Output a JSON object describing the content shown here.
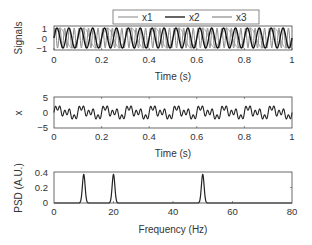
{
  "chart_data": [
    {
      "type": "line",
      "title": "",
      "xlabel": "Time (s)",
      "ylabel": "Signals",
      "xlim": [
        0,
        1
      ],
      "ylim": [
        -1.2,
        1.2
      ],
      "xticks": [
        "0",
        "0.2",
        "0.4",
        "0.6",
        "0.8",
        "1"
      ],
      "yticks": [
        "-1",
        "0",
        "1"
      ],
      "legend": {
        "position": "top-center-outside",
        "orientation": "horizontal",
        "entries": [
          "x1",
          "x2",
          "x3"
        ]
      },
      "series": [
        {
          "name": "x1",
          "description": "sin(2π·10t)",
          "frequency_hz": 10,
          "amplitude": 1,
          "color": "#999999"
        },
        {
          "name": "x2",
          "description": "sin(2π·20t)",
          "frequency_hz": 20,
          "amplitude": 1,
          "color": "#111111"
        },
        {
          "name": "x3",
          "description": "sin(2π·50t)",
          "frequency_hz": 50,
          "amplitude": 1,
          "color": "#888888"
        }
      ],
      "grid": false
    },
    {
      "type": "line",
      "title": "",
      "xlabel": "Time (s)",
      "ylabel": "x",
      "xlim": [
        0,
        1
      ],
      "ylim": [
        -5,
        5
      ],
      "xticks": [
        "0",
        "0.2",
        "0.4",
        "0.6",
        "0.8",
        "1"
      ],
      "yticks": [
        "-5",
        "0",
        "5"
      ],
      "series": [
        {
          "name": "x",
          "description": "x1 + x2 + x3",
          "color": "#222222"
        }
      ],
      "grid": false
    },
    {
      "type": "line",
      "title": "",
      "xlabel": "Frequency (Hz)",
      "ylabel": "PSD (A.U.)",
      "xlim": [
        0,
        80
      ],
      "ylim": [
        0,
        0.4
      ],
      "xticks": [
        "0",
        "20",
        "40",
        "60",
        "80"
      ],
      "yticks": [
        "0",
        "0.2",
        "0.4"
      ],
      "series": [
        {
          "name": "PSD",
          "peaks": [
            {
              "x": 10,
              "y": 0.37
            },
            {
              "x": 20,
              "y": 0.37
            },
            {
              "x": 50,
              "y": 0.37
            }
          ],
          "color": "#222222"
        }
      ],
      "grid": false
    }
  ],
  "panels": {
    "top": {
      "ylabel": "Signals",
      "xlabel": "Time (s)",
      "xticks": [
        "0",
        "0.2",
        "0.4",
        "0.6",
        "0.8",
        "1"
      ],
      "yticks": [
        "1",
        "0",
        "−1"
      ],
      "legend": [
        {
          "label": "x1",
          "color": "#9a9a9a"
        },
        {
          "label": "x2",
          "color": "#111111"
        },
        {
          "label": "x3",
          "color": "#8a8a8a"
        }
      ]
    },
    "middle": {
      "ylabel": "x",
      "xlabel": "Time (s)",
      "xticks": [
        "0",
        "0.2",
        "0.4",
        "0.6",
        "0.8",
        "1"
      ],
      "yticks": [
        "5",
        "0",
        "−5"
      ]
    },
    "bottom": {
      "ylabel": "PSD (A.U.)",
      "xlabel": "Frequency (Hz)",
      "xticks": [
        "0",
        "20",
        "40",
        "60",
        "80"
      ],
      "yticks": [
        "0.4",
        "0.2",
        "0"
      ]
    }
  }
}
